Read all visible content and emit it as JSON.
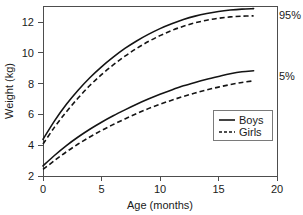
{
  "chart_data": {
    "type": "line",
    "title": "",
    "xlabel": "Age (months)",
    "ylabel": "Weight (kg)",
    "xlim": [
      0,
      20
    ],
    "ylim": [
      2,
      12.9
    ],
    "grid": false,
    "legend_position": "inside-lower-right",
    "x_ticks": [
      0,
      5,
      10,
      15,
      20
    ],
    "x_tick_labels": [
      "0",
      "5",
      "10",
      "15",
      "20"
    ],
    "y_ticks": [
      2,
      4,
      6,
      8,
      10,
      12
    ],
    "y_tick_labels": [
      "2",
      "4",
      "6",
      "8",
      "10",
      "12"
    ],
    "x": [
      0,
      1,
      2,
      3,
      4,
      5,
      6,
      7,
      8,
      9,
      10,
      11,
      12,
      13,
      14,
      15,
      16,
      17,
      18
    ],
    "series": [
      {
        "name": "Boys 95th percentile",
        "legend": "Boys",
        "annotation": "95%",
        "style": "solid",
        "percentile": "95%",
        "sex": "Boys",
        "values": [
          4.35,
          5.55,
          6.6,
          7.5,
          8.3,
          9.0,
          9.62,
          10.18,
          10.66,
          11.08,
          11.45,
          11.76,
          12.03,
          12.25,
          12.42,
          12.55,
          12.64,
          12.7,
          12.73
        ]
      },
      {
        "name": "Girls 95th percentile",
        "legend": "Girls",
        "annotation": "95%",
        "style": "dashed",
        "percentile": "95%",
        "sex": "Girls",
        "values": [
          4.05,
          5.15,
          6.12,
          7.0,
          7.8,
          8.5,
          9.12,
          9.68,
          10.18,
          10.62,
          11.0,
          11.33,
          11.6,
          11.82,
          11.99,
          12.11,
          12.2,
          12.25,
          12.27
        ]
      },
      {
        "name": "Boys 5th percentile",
        "legend": "Boys",
        "annotation": "5%",
        "style": "solid",
        "percentile": "5%",
        "sex": "Boys",
        "values": [
          2.65,
          3.33,
          3.95,
          4.5,
          5.0,
          5.45,
          5.86,
          6.24,
          6.6,
          6.93,
          7.24,
          7.52,
          7.78,
          8.0,
          8.2,
          8.38,
          8.55,
          8.68,
          8.75
        ]
      },
      {
        "name": "Girls 5th percentile",
        "legend": "Girls",
        "annotation": "5%",
        "style": "dashed",
        "percentile": "5%",
        "sex": "Girls",
        "values": [
          2.42,
          3.0,
          3.55,
          4.05,
          4.5,
          4.92,
          5.3,
          5.66,
          6.0,
          6.32,
          6.6,
          6.86,
          7.1,
          7.32,
          7.52,
          7.7,
          7.86,
          8.0,
          8.1
        ]
      }
    ],
    "annotations": [
      {
        "text": "95%",
        "x": 18.6,
        "y": 12.6
      },
      {
        "text": "5%",
        "x": 18.6,
        "y": 8.5
      }
    ],
    "legend_entries": [
      {
        "label": "Boys",
        "style": "solid"
      },
      {
        "label": "Girls",
        "style": "dashed"
      }
    ]
  }
}
